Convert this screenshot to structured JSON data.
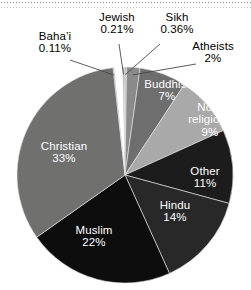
{
  "chart_data": {
    "type": "pie",
    "title": "",
    "subtitle": "",
    "xlabel": "",
    "ylabel": "",
    "legend_position": "none",
    "grid": false,
    "units": "percent",
    "labels_inside_slices": [
      "Christian",
      "Buddhist",
      "Non-religious",
      "Other",
      "Hindu",
      "Muslim"
    ],
    "labels_with_leader_lines": [
      "Baha'i",
      "Jewish",
      "Sikh",
      "Atheists"
    ],
    "categories": [
      "Jewish",
      "Sikh",
      "Atheists",
      "Buddhist",
      "Non-religious",
      "Other",
      "Hindu",
      "Muslim",
      "Christian",
      "Baha'i"
    ],
    "values": [
      0.21,
      0.36,
      2,
      7,
      9,
      11,
      14,
      22,
      33,
      0.11
    ],
    "slices": [
      {
        "name": "Jewish",
        "label": "Jewish",
        "value": 0.21,
        "value_text": "0.21%",
        "color": "#8f8f8f",
        "start_deg": 0.0,
        "sweep_deg": 0.76,
        "text_color": "#000000",
        "placement": "outside"
      },
      {
        "name": "Sikh",
        "label": "Sikh",
        "value": 0.36,
        "value_text": "0.36%",
        "color": "#bdbdbd",
        "start_deg": 0.76,
        "sweep_deg": 1.3,
        "text_color": "#000000",
        "placement": "outside"
      },
      {
        "name": "Atheists",
        "label": "Atheists",
        "value": 2,
        "value_text": "2%",
        "color": "#8a8a8a",
        "start_deg": 2.06,
        "sweep_deg": 7.2,
        "text_color": "#000000",
        "placement": "outside"
      },
      {
        "name": "Buddhist",
        "label": "Buddhist",
        "value": 7,
        "value_text": "7%",
        "color": "#6e6e6e",
        "start_deg": 9.26,
        "sweep_deg": 25.2,
        "text_color": "#ffffff",
        "placement": "inside"
      },
      {
        "name": "Non-religious",
        "label": "Non-\nreligious",
        "value": 9,
        "value_text": "9%",
        "color": "#a9a9a9",
        "start_deg": 34.46,
        "sweep_deg": 32.4,
        "text_color": "#ffffff",
        "placement": "inside"
      },
      {
        "name": "Other",
        "label": "Other",
        "value": 11,
        "value_text": "11%",
        "color": "#1c1c1c",
        "start_deg": 66.86,
        "sweep_deg": 39.6,
        "text_color": "#ffffff",
        "placement": "inside"
      },
      {
        "name": "Hindu",
        "label": "Hindu",
        "value": 14,
        "value_text": "14%",
        "color": "#282828",
        "start_deg": 106.46,
        "sweep_deg": 50.4,
        "text_color": "#ffffff",
        "placement": "inside"
      },
      {
        "name": "Muslim",
        "label": "Muslim",
        "value": 22,
        "value_text": "22%",
        "color": "#0d0d0d",
        "start_deg": 156.86,
        "sweep_deg": 79.2,
        "text_color": "#ffffff",
        "placement": "inside"
      },
      {
        "name": "Christian",
        "label": "Christian",
        "value": 33,
        "value_text": "33%",
        "color": "#70706f",
        "start_deg": 236.06,
        "sweep_deg": 118.8,
        "text_color": "#ffffff",
        "placement": "inside"
      },
      {
        "name": "Baha'i",
        "label": "Baha’i",
        "value": 0.11,
        "value_text": "0.11%",
        "color": "#7a7a7a",
        "start_deg": 354.86,
        "sweep_deg": 0.4,
        "text_color": "#000000",
        "placement": "outside"
      }
    ]
  },
  "labels": {
    "bahai": {
      "name": "Baha’i",
      "pct": "0.11%"
    },
    "jewish": {
      "name": "Jewish",
      "pct": "0.21%"
    },
    "sikh": {
      "name": "Sikh",
      "pct": "0.36%"
    },
    "atheists": {
      "name": "Atheists",
      "pct": "2%"
    },
    "buddhist": {
      "name": "Buddhist",
      "pct": "7%"
    },
    "nonrel": {
      "name_line1": "Non-",
      "name_line2": "religious",
      "pct": "9%"
    },
    "other": {
      "name": "Other",
      "pct": "11%"
    },
    "hindu": {
      "name": "Hindu",
      "pct": "14%"
    },
    "muslim": {
      "name": "Muslim",
      "pct": "22%"
    },
    "christian": {
      "name": "Christian",
      "pct": "33%"
    }
  },
  "geometry": {
    "center_x": 125,
    "center_y": 175,
    "radius": 108
  },
  "colors": {
    "background": "#ffffff",
    "text_outside": "#000000",
    "text_inside": "#ffffff",
    "christian": "#70706f",
    "buddhist": "#6e6e6e",
    "nonreligious": "#a9a9a9",
    "other": "#1c1c1c",
    "hindu": "#282828",
    "muslim": "#0d0d0d",
    "atheists": "#8a8a8a",
    "sikh": "#bdbdbd",
    "jewish": "#8f8f8f",
    "bahai": "#7a7a7a",
    "leader_line": "#4a4a4a"
  }
}
